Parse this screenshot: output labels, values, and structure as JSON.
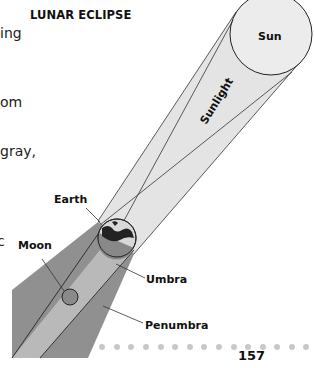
{
  "figure": {
    "title": "LUNAR ECLIPSE",
    "labels": {
      "sun": "Sun",
      "sunlight": "Sunlight",
      "earth": "Earth",
      "moon": "Moon",
      "umbra": "Umbra",
      "penumbra": "Penumbra"
    },
    "colors": {
      "sun_fill": "#ececec",
      "sunlight_fill": "#e4e4e4",
      "umbra_fill": "#b8b8b8",
      "penumbra_fill": "#8f8f8f",
      "earth_shadow": "#7a7a7a",
      "moon_fill": "#8a8a8a",
      "dots": "#c8c8c8"
    }
  },
  "body_text_fragments": [
    "ing",
    "om",
    "gray,",
    "c"
  ],
  "footer": {
    "page_number": "157"
  }
}
